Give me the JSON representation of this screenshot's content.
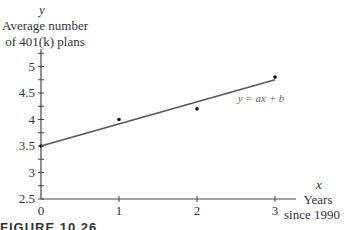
{
  "chart_data": {
    "type": "scatter",
    "title": "",
    "xlabel": "Years since 1990",
    "xvar": "x",
    "ylabel": "Average number of 401(k) plans",
    "yvar": "y",
    "x_ticks": [
      "0",
      "1",
      "2",
      "3"
    ],
    "y_ticks": [
      "2.5",
      "3",
      "3.5",
      "4",
      "4.5",
      "5"
    ],
    "xlim": [
      0,
      3
    ],
    "ylim": [
      2.5,
      5.25
    ],
    "grid": false,
    "series": [
      {
        "name": "data points",
        "type": "scatter",
        "x": [
          0,
          1,
          2,
          3
        ],
        "y": [
          3.5,
          4.0,
          4.2,
          4.8
        ]
      },
      {
        "name": "y = ax + b",
        "type": "line",
        "x": [
          0,
          3
        ],
        "y": [
          3.5,
          4.75
        ]
      }
    ],
    "annotations": [
      "y = ax + b"
    ]
  },
  "labels": {
    "y_var": "y",
    "y_title_line1": "Average number",
    "y_title_line2": "of 401(k) plans",
    "x_var": "x",
    "x_title_line1": "Years",
    "x_title_line2": "since 1990",
    "line_label": "y = ax + b",
    "caption": "FIGURE 10.26"
  }
}
